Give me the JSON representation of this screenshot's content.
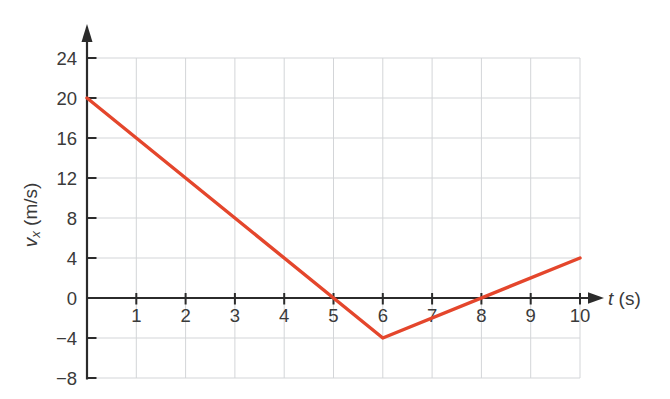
{
  "figure": {
    "background": "#ffffff"
  },
  "chart_data": {
    "type": "line",
    "title": "",
    "xlabel": "t (s)",
    "ylabel": "v_x (m/s)",
    "x_axis": {
      "label_variable": "t",
      "label_unit": " (s)",
      "range": [
        0,
        10.5
      ],
      "ticks": [
        {
          "value": 1,
          "label": "1"
        },
        {
          "value": 2,
          "label": "2"
        },
        {
          "value": 3,
          "label": "3"
        },
        {
          "value": 4,
          "label": "4"
        },
        {
          "value": 5,
          "label": "5"
        },
        {
          "value": 6,
          "label": "6"
        },
        {
          "value": 7,
          "label": "7"
        },
        {
          "value": 8,
          "label": "8"
        },
        {
          "value": 9,
          "label": "9"
        },
        {
          "value": 10,
          "label": "10"
        }
      ]
    },
    "y_axis": {
      "label_variable": "v",
      "label_subscript": "x",
      "label_unit": " (m/s)",
      "range": [
        -8,
        26
      ],
      "ticks": [
        {
          "value": 24,
          "label": "24"
        },
        {
          "value": 20,
          "label": "20"
        },
        {
          "value": 16,
          "label": "16"
        },
        {
          "value": 12,
          "label": "12"
        },
        {
          "value": 8,
          "label": "8"
        },
        {
          "value": 4,
          "label": "4"
        },
        {
          "value": 0,
          "label": "0"
        },
        {
          "value": -4,
          "label": "−4"
        },
        {
          "value": -8,
          "label": "−8"
        }
      ]
    },
    "grid": {
      "show": true,
      "color": "#d3d5d8"
    },
    "axis_color": "#2b2b2b",
    "text_color": "#3a3a3a",
    "series": [
      {
        "name": "velocity",
        "color": "#e4462c",
        "stroke_width": 3.4,
        "points": [
          [
            0,
            20
          ],
          [
            6,
            -4
          ],
          [
            10,
            4
          ]
        ]
      }
    ]
  }
}
